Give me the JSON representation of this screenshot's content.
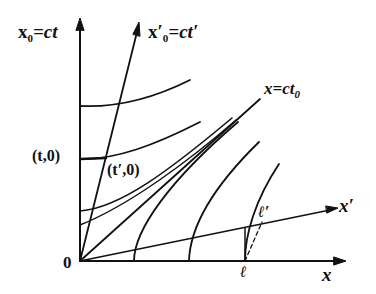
{
  "figure": {
    "type": "Minkowski spacetime diagram (Lorentz contraction)",
    "colors": {
      "ink": "#111111",
      "background": "#ffffff"
    },
    "labels": {
      "time_axis": {
        "main": "x",
        "sub": "0",
        "rest": "=ct"
      },
      "time_axis_prime": {
        "main": "x",
        "prime": "′",
        "sub": "0",
        "rest": "=ct′"
      },
      "light_line": {
        "main": "x=ct",
        "sub": "0"
      },
      "x_axis": "x",
      "x_axis_prime": "x′",
      "origin": "0",
      "event_t": "(t,0)",
      "event_t_prime": "(t′,0)",
      "length": "ℓ",
      "length_prime": "ℓ′"
    },
    "elements": {
      "axes": [
        "x0 (vertical)",
        "x (horizontal)",
        "x0' (tilted toward light line)",
        "x' (tilted toward light line)"
      ],
      "light_line": "x = ct0 (45° diagonal)",
      "timelike_hyperbolas": 3,
      "spacelike_hyperbolas": 3,
      "dashed_segment": "from ℓ on x-axis to ℓ′ on x′-axis"
    }
  }
}
